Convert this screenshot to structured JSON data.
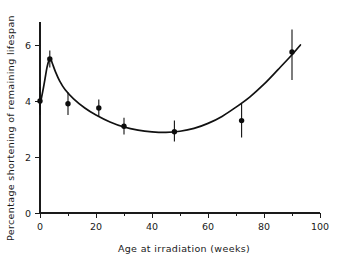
{
  "chart_data": {
    "type": "scatter",
    "title": "",
    "xlabel": "Age at irradiation (weeks)",
    "ylabel": "Percentage shortening of remaining lifespan",
    "xlim": [
      0,
      100
    ],
    "ylim": [
      0,
      6.6
    ],
    "grid": false,
    "legend": "none",
    "x_ticks": [
      0,
      20,
      40,
      60,
      80,
      100
    ],
    "x_tick_labels": [
      "0",
      "20",
      "40",
      "60",
      "80",
      "100"
    ],
    "x_minor_ticks": [
      10,
      30,
      50,
      70,
      90
    ],
    "y_ticks": [
      0,
      2,
      4,
      6
    ],
    "y_tick_labels": [
      "0",
      "2",
      "4",
      "6"
    ],
    "series": [
      {
        "name": "observed",
        "marker": "filled-circle",
        "points": [
          {
            "x": 0,
            "y": 4.0,
            "y_low": 3.5,
            "y_high": 4.5
          },
          {
            "x": 3.5,
            "y": 5.5,
            "y_low": 5.2,
            "y_high": 5.8
          },
          {
            "x": 10,
            "y": 3.9,
            "y_low": 3.5,
            "y_high": 4.3
          },
          {
            "x": 21,
            "y": 3.75,
            "y_low": 3.45,
            "y_high": 4.05
          },
          {
            "x": 30,
            "y": 3.1,
            "y_low": 2.8,
            "y_high": 3.4
          },
          {
            "x": 48,
            "y": 2.9,
            "y_low": 2.55,
            "y_high": 3.3
          },
          {
            "x": 72,
            "y": 3.3,
            "y_low": 2.7,
            "y_high": 3.9
          },
          {
            "x": 90,
            "y": 5.75,
            "y_low": 4.75,
            "y_high": 6.55
          }
        ]
      },
      {
        "name": "fitted-curve",
        "marker": "none",
        "curve": [
          {
            "x": 0,
            "y": 3.85
          },
          {
            "x": 1.0,
            "y": 4.35
          },
          {
            "x": 1.8,
            "y": 4.8
          },
          {
            "x": 2.5,
            "y": 5.2
          },
          {
            "x": 3.2,
            "y": 5.45
          },
          {
            "x": 3.8,
            "y": 5.5
          },
          {
            "x": 4.5,
            "y": 5.32
          },
          {
            "x": 5.5,
            "y": 5.05
          },
          {
            "x": 7,
            "y": 4.72
          },
          {
            "x": 9,
            "y": 4.4
          },
          {
            "x": 12,
            "y": 4.08
          },
          {
            "x": 16,
            "y": 3.75
          },
          {
            "x": 20,
            "y": 3.5
          },
          {
            "x": 25,
            "y": 3.25
          },
          {
            "x": 30,
            "y": 3.07
          },
          {
            "x": 35,
            "y": 2.96
          },
          {
            "x": 40,
            "y": 2.9
          },
          {
            "x": 45,
            "y": 2.88
          },
          {
            "x": 50,
            "y": 2.92
          },
          {
            "x": 55,
            "y": 3.02
          },
          {
            "x": 60,
            "y": 3.2
          },
          {
            "x": 65,
            "y": 3.45
          },
          {
            "x": 70,
            "y": 3.78
          },
          {
            "x": 75,
            "y": 4.15
          },
          {
            "x": 80,
            "y": 4.6
          },
          {
            "x": 85,
            "y": 5.12
          },
          {
            "x": 90,
            "y": 5.65
          },
          {
            "x": 93,
            "y": 6.0
          }
        ]
      }
    ]
  }
}
